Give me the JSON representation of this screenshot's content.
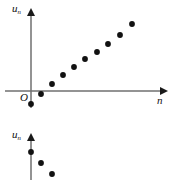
{
  "figure": {
    "width": 177,
    "height": 180,
    "background": "#ffffff",
    "ink_color": "#111111",
    "axis_color": "#6f6f6f"
  },
  "labels": {
    "u_symbol": "u",
    "n_subscript": "n",
    "n_axis": "n",
    "origin": "O"
  },
  "chart_data": [
    {
      "id": "upper-plot",
      "type": "scatter",
      "title": "",
      "xlabel": "n",
      "ylabel": "u",
      "ylabel_subscript": "n",
      "origin_label": "O",
      "grid": false,
      "legend": null,
      "axis": {
        "x_axis_pixel_y": 91,
        "y_axis_pixel_x": 31,
        "x_arrow": "right",
        "y_arrow": "up",
        "x_start_px": 5,
        "x_end_px": 168,
        "y_start_px": 8,
        "y_end_px": 108
      },
      "xlim": [
        0,
        10
      ],
      "ylim": [
        -1.5,
        8
      ],
      "x": [
        0,
        1,
        2,
        3,
        4,
        5,
        6,
        7,
        8,
        9
      ],
      "y": [
        -1.3,
        -0.3,
        0.8,
        1.9,
        2.7,
        3.5,
        4.2,
        5.0,
        5.8,
        6.8
      ],
      "points_px": [
        {
          "cx": 31,
          "cy": 104,
          "r": 2.9
        },
        {
          "cx": 41,
          "cy": 94,
          "r": 2.9
        },
        {
          "cx": 52,
          "cy": 84,
          "r": 2.9
        },
        {
          "cx": 63,
          "cy": 75,
          "r": 2.9
        },
        {
          "cx": 74,
          "cy": 67,
          "r": 2.9
        },
        {
          "cx": 85,
          "cy": 59,
          "r": 2.9
        },
        {
          "cx": 97,
          "cy": 52,
          "r": 2.9
        },
        {
          "cx": 108,
          "cy": 44,
          "r": 2.9
        },
        {
          "cx": 120,
          "cy": 35,
          "r": 2.9
        },
        {
          "cx": 132,
          "cy": 24,
          "r": 2.9
        }
      ]
    },
    {
      "id": "lower-plot",
      "type": "scatter",
      "title": "",
      "xlabel": "",
      "ylabel": "u",
      "ylabel_subscript": "n",
      "origin_label": "",
      "grid": false,
      "legend": null,
      "axis": {
        "y_axis_pixel_x": 31,
        "y_arrow": "up",
        "y_start_px": 133,
        "y_end_px": 180
      },
      "xlim": [
        0,
        10
      ],
      "ylim": [
        -4,
        2
      ],
      "x": [
        0,
        1,
        2
      ],
      "y": [
        0.6,
        -0.6,
        -1.8
      ],
      "points_px": [
        {
          "cx": 31,
          "cy": 152,
          "r": 2.9
        },
        {
          "cx": 41,
          "cy": 163,
          "r": 2.9
        },
        {
          "cx": 52,
          "cy": 174,
          "r": 2.9
        }
      ]
    }
  ]
}
